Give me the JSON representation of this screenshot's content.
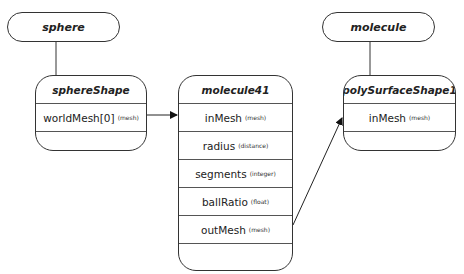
{
  "transforms": [
    {
      "id": "sphere",
      "label": "sphere"
    },
    {
      "id": "molecule",
      "label": "molecule"
    }
  ],
  "nodes": [
    {
      "id": "sphereShape",
      "title": "sphereShape",
      "attributes": [
        {
          "name": "worldMesh[0]",
          "type": "(mesh)"
        }
      ]
    },
    {
      "id": "molecule41",
      "title": "molecule41",
      "attributes": [
        {
          "name": "inMesh",
          "type": "(mesh)"
        },
        {
          "name": "radius",
          "type": "(distance)"
        },
        {
          "name": "segments",
          "type": "(integer)"
        },
        {
          "name": "ballRatio",
          "type": "(float)"
        },
        {
          "name": "outMesh",
          "type": "(mesh)"
        }
      ]
    },
    {
      "id": "polySurfaceShape1",
      "title": "polySurfaceShape1",
      "attributes": [
        {
          "name": "inMesh",
          "type": "(mesh)"
        }
      ]
    }
  ],
  "connections": [
    {
      "from": "sphere",
      "to": "sphereShape",
      "kind": "parent"
    },
    {
      "from": "molecule",
      "to": "polySurfaceShape1",
      "kind": "parent"
    },
    {
      "from": "sphereShape.worldMesh[0]",
      "to": "molecule41.inMesh",
      "kind": "data"
    },
    {
      "from": "molecule41.outMesh",
      "to": "polySurfaceShape1.inMesh",
      "kind": "data"
    }
  ]
}
